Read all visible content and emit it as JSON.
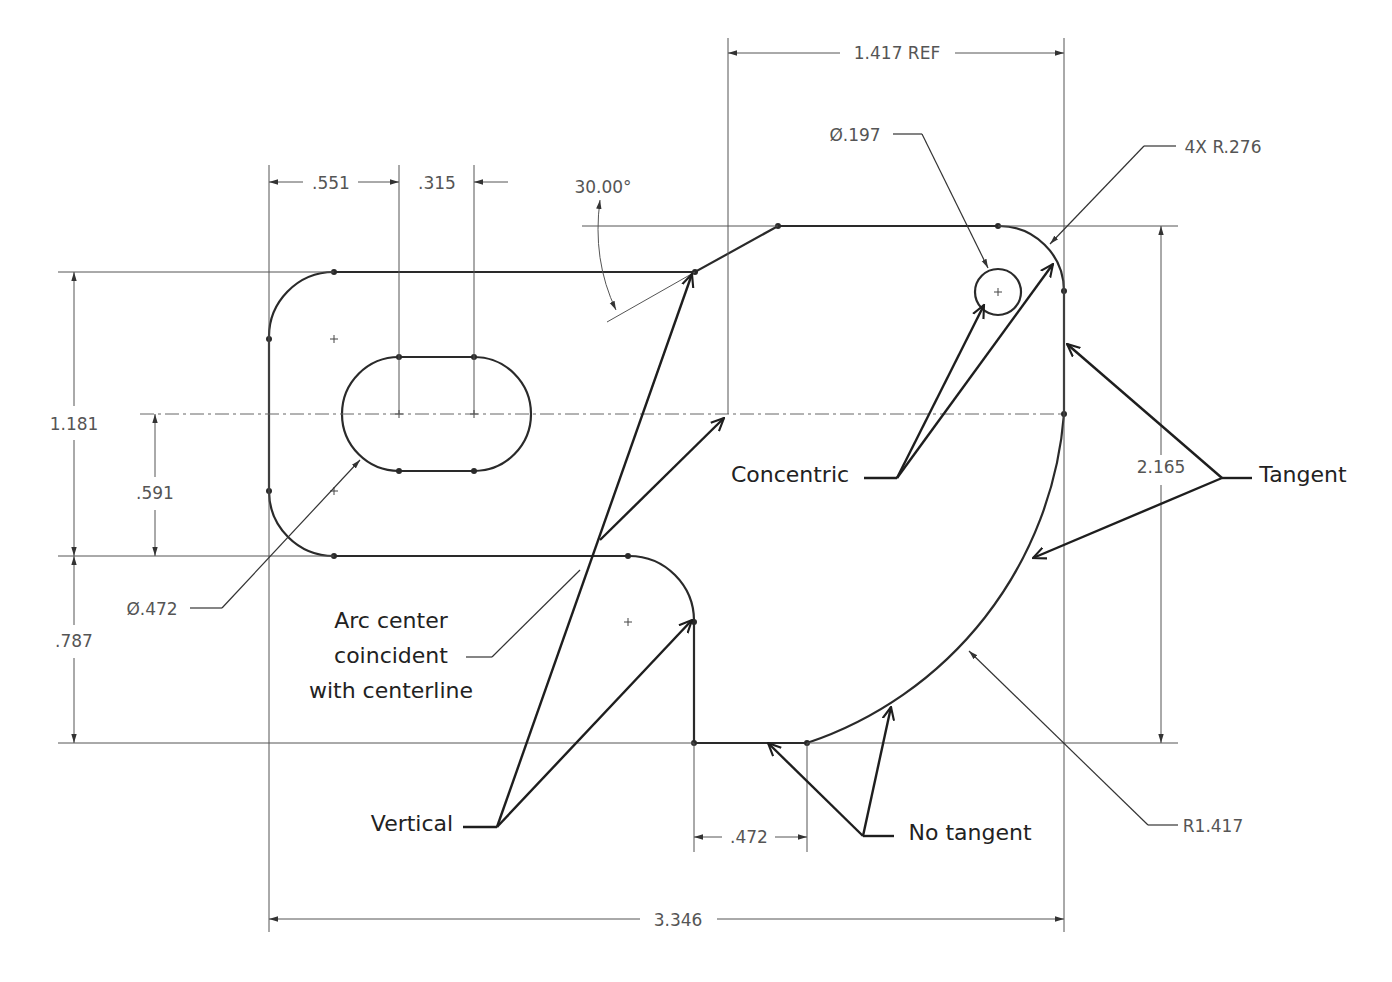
{
  "drawing": {
    "type": "sketch-relations-drawing",
    "units": "in"
  },
  "dimensions": {
    "ref_width": "1.417 REF",
    "slot_offset": ".551",
    "slot_length": ".315",
    "angle": "30.00°",
    "hole_diameter": "Ø.197",
    "corner_radius": "4X R.276",
    "left_height": "1.181",
    "center_offset": ".591",
    "slot_width": "Ø.472",
    "lower_height": ".787",
    "overall_height": "2.165",
    "bottom_flat": ".472",
    "overall_width": "3.346",
    "large_radius": "R1.417"
  },
  "annotations": {
    "concentric": "Concentric",
    "tangent": "Tangent",
    "arc_center_line1": "Arc center",
    "arc_center_line2": "coincident",
    "arc_center_line3": "with centerline",
    "vertical": "Vertical",
    "no_tangent": "No tangent"
  },
  "colors": {
    "geometry": "#2a2a2a",
    "dimension_text": "#555555",
    "annotation_text": "#222222",
    "background": "#ffffff"
  }
}
